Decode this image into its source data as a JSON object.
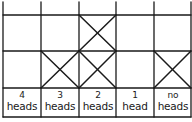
{
  "diagram": {
    "type": "tally-grid",
    "line_color": "#1a1a1a",
    "columns": [
      {
        "number": "4",
        "word": "heads",
        "crosses": [
          false,
          false
        ]
      },
      {
        "number": "3",
        "word": "heads",
        "crosses": [
          false,
          true
        ]
      },
      {
        "number": "2",
        "word": "heads",
        "crosses": [
          true,
          true
        ]
      },
      {
        "number": "1",
        "word": "head",
        "crosses": [
          false,
          false
        ]
      },
      {
        "number": "no",
        "word": "heads",
        "crosses": [
          false,
          true
        ]
      }
    ]
  }
}
